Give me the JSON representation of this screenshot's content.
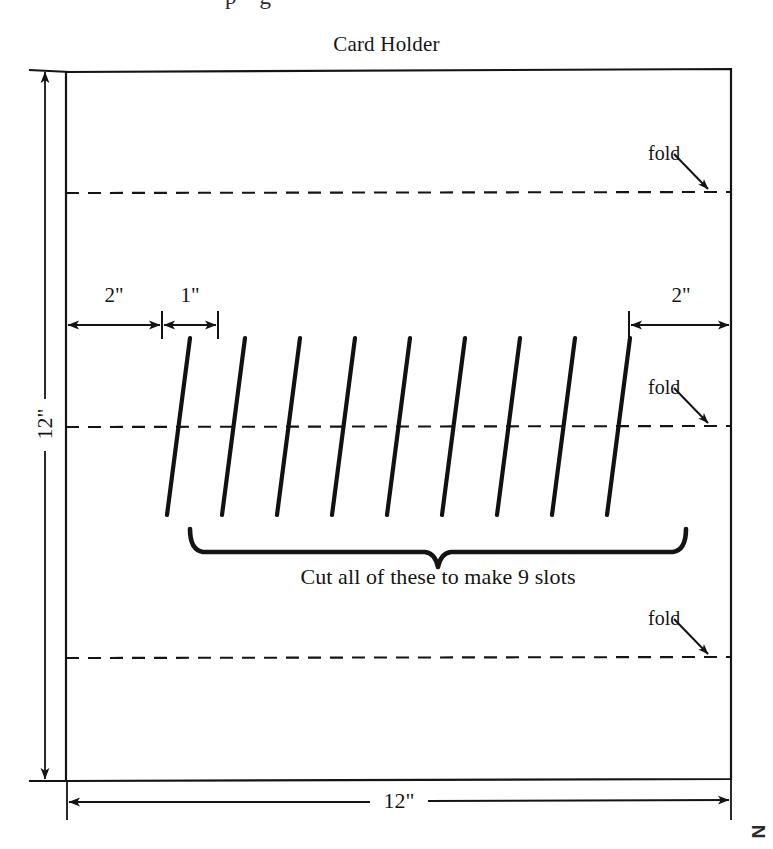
{
  "page": {
    "width": 773,
    "height": 849,
    "background": "#ffffff",
    "ink": "#141414",
    "top_partial_text": "p    g"
  },
  "diagram": {
    "title": "Card Holder",
    "sheet": {
      "left": 66,
      "top": 69,
      "right": 731,
      "bottom": 781,
      "stroke": "#141414",
      "stroke_width": 2.2
    },
    "fold_lines": [
      {
        "id": "fold-top",
        "label": "fold",
        "y": 193,
        "label_x": 648,
        "label_y": 152
      },
      {
        "id": "fold-middle",
        "label": "fold",
        "y": 427,
        "label_x": 648,
        "label_y": 386
      },
      {
        "id": "fold-bottom",
        "label": "fold",
        "y": 658,
        "label_x": 648,
        "label_y": 617
      }
    ],
    "dimensions": {
      "height": {
        "label": "12\"",
        "axis_x": 45,
        "top_y": 70,
        "bottom_y": 781,
        "label_x": 45,
        "label_y": 425
      },
      "width": {
        "label": "12\"",
        "axis_y": 802,
        "left_x": 67,
        "right_x": 731,
        "label_x": 399,
        "label_y": 802
      },
      "margin_left": {
        "label": "2\"",
        "axis_y": 325,
        "from_x": 66,
        "to_x": 162,
        "label_x": 114,
        "label_y": 296
      },
      "slot_pitch": {
        "label": "1\"",
        "axis_y": 325,
        "from_x": 162,
        "to_x": 218,
        "label_x": 190,
        "label_y": 296
      },
      "margin_right": {
        "label": "2\"",
        "axis_y": 325,
        "from_x": 629,
        "to_x": 731,
        "label_x": 681,
        "label_y": 296
      }
    },
    "slots": {
      "count": 9,
      "top_y": 338,
      "bottom_y": 515,
      "slant_dx": -23,
      "first_top_x": 190,
      "pitch": 55,
      "stroke_width": 4.2,
      "stroke": "#111111"
    },
    "brace": {
      "left_x": 190,
      "right_x": 686,
      "top_y": 529,
      "depth_y": 556,
      "tip_x": 438
    },
    "caption": {
      "text": "Cut all of these to make 9 slots",
      "x": 438,
      "y": 576
    },
    "corner_artifact": {
      "text": "N",
      "x": 757,
      "y": 832
    }
  }
}
